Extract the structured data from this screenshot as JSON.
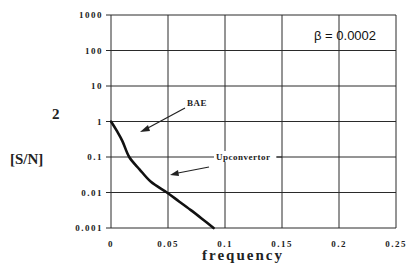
{
  "chart_data": {
    "type": "line",
    "title": "",
    "xlabel": "frequency",
    "ylabel": "[S/N]",
    "ylabel_superscript": "2",
    "yscale": "log",
    "xlim": [
      0,
      0.25
    ],
    "ylim": [
      0.001,
      1000
    ],
    "grid": true,
    "x_ticks": [
      "0",
      "0.05",
      "0.1",
      "0.15",
      "0.2",
      "0.25"
    ],
    "y_ticks": [
      "1000",
      "100",
      "10",
      "1",
      "0.1",
      "0.01",
      "0.001"
    ],
    "series": [
      {
        "name": "[S/N]^2",
        "x": [
          0,
          0.005,
          0.01,
          0.016,
          0.025,
          0.035,
          0.049,
          0.06,
          0.07,
          0.08,
          0.09
        ],
        "y": [
          1,
          0.55,
          0.28,
          0.1,
          0.045,
          0.02,
          0.01,
          0.0055,
          0.0032,
          0.0018,
          0.001
        ]
      }
    ],
    "annotations": [
      {
        "text": "β = 0.0002",
        "kind": "parameter"
      },
      {
        "text": "BAE",
        "kind": "arrow-label"
      },
      {
        "text": "Upconvertor",
        "kind": "arrow-label"
      }
    ]
  },
  "labels": {
    "beta": "β = 0.0002",
    "bae": "BAE",
    "upconvertor": "Upconvertor",
    "xlabel": "frequency",
    "ylabel": "[S/N]",
    "ylabel_sup": "2"
  },
  "colors": {
    "curve": "#111111",
    "grid": "#2a2a2a",
    "background": "#ffffff"
  }
}
